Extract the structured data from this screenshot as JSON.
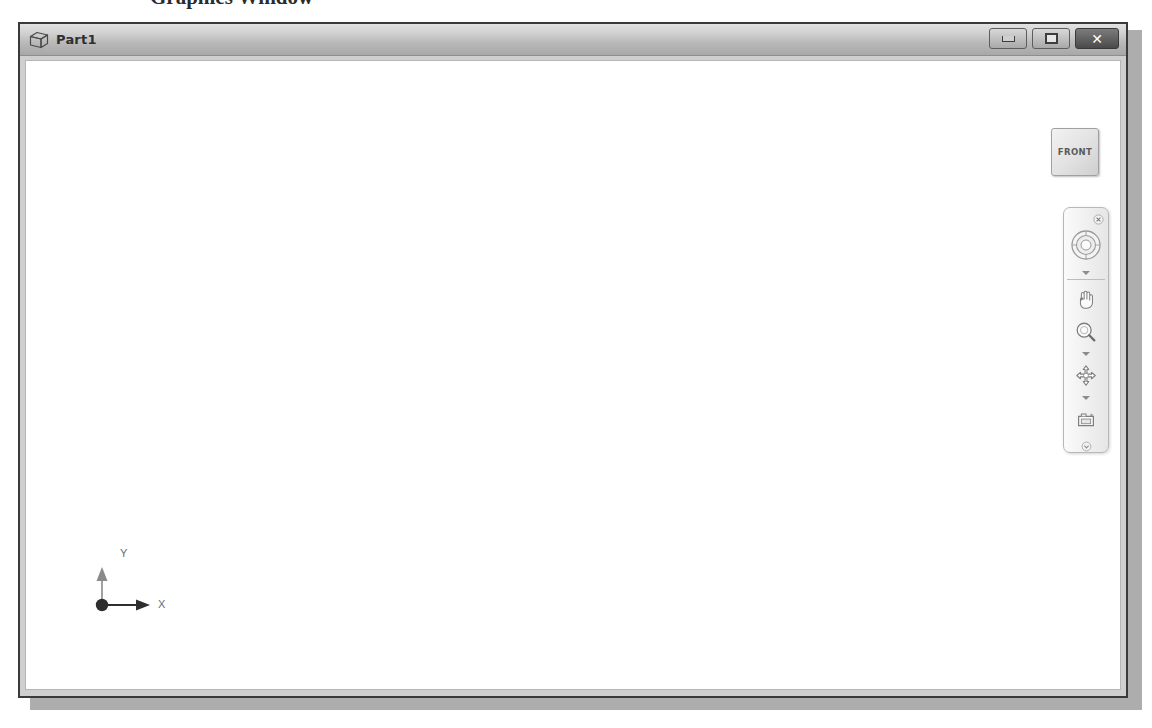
{
  "caption": {
    "text": "Graphics Window"
  },
  "window": {
    "title": "Part1",
    "icon": "cube-icon",
    "controls": {
      "minimize": {
        "name": "minimize-button",
        "glyph": "—"
      },
      "maximize": {
        "name": "restore-button",
        "glyph": "❐"
      },
      "close": {
        "name": "close-button",
        "glyph": "✕"
      }
    }
  },
  "viewcube": {
    "label": "FRONT"
  },
  "navbar": {
    "close_label": "×",
    "menu_label": "▾",
    "tools": [
      {
        "name": "steering-wheel-icon",
        "label": "Full Navigation Wheel"
      },
      {
        "name": "pan-hand-icon",
        "label": "Pan"
      },
      {
        "name": "zoom-magnifier-icon",
        "label": "Zoom"
      },
      {
        "name": "orbit-icon",
        "label": "Orbit"
      },
      {
        "name": "camera-icon",
        "label": "Look At"
      }
    ]
  },
  "axis_indicator": {
    "y_label": "Y",
    "x_label": "X",
    "origin_color": "#2e2e2e",
    "x_axis_color": "#2e2e2e",
    "y_axis_color": "#8a8a8a"
  },
  "canvas": {
    "background": "#ffffff"
  }
}
